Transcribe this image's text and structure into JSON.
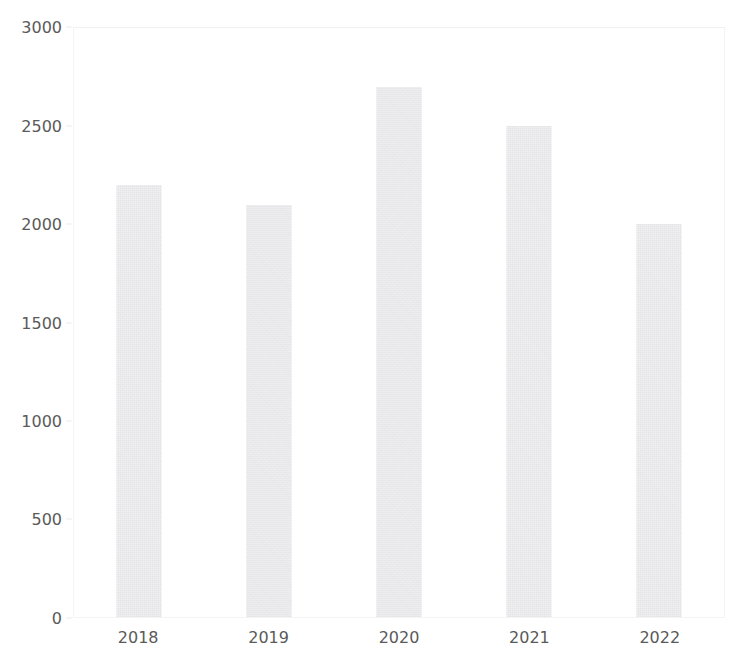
{
  "chart_data": {
    "type": "bar",
    "title": "",
    "xlabel": "",
    "ylabel": "",
    "categories": [
      "2018",
      "2019",
      "2020",
      "2021",
      "2022"
    ],
    "values": [
      2200,
      2100,
      2700,
      2500,
      2000
    ],
    "series": [
      {
        "name": "",
        "values": [
          2200,
          2100,
          2700,
          2500,
          2000
        ]
      }
    ],
    "ylim": [
      0,
      3000
    ],
    "y_ticks": [
      0,
      500,
      1000,
      1500,
      2000,
      2500,
      3000
    ],
    "y_tick_labels": [
      "0",
      "500",
      "1000",
      "1500",
      "2000",
      "2500",
      "3000"
    ],
    "grid": false,
    "legend": "none",
    "bar_color": "#f2f2f3",
    "axis_label_color": "#5a5a5a",
    "plot_border_color": "#f4f4f5",
    "background_color": "#ffffff"
  }
}
